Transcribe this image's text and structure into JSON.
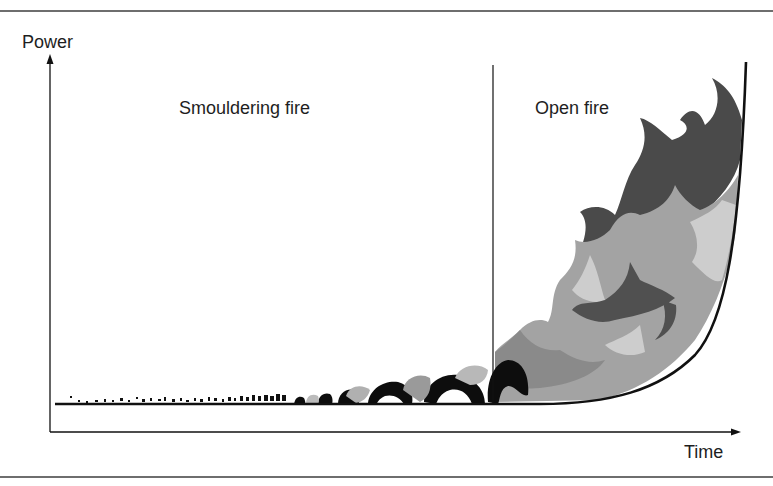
{
  "diagram": {
    "axes": {
      "y_label": "Power",
      "x_label": "Time"
    },
    "phases": [
      {
        "name": "smouldering",
        "label": "Smouldering fire"
      },
      {
        "name": "open",
        "label": "Open fire"
      }
    ],
    "colors": {
      "axis": "#111111",
      "rule": "#6e6e6e",
      "flame_dark": "#4a4a4a",
      "flame_mid": "#8c8c8c",
      "flame_light": "#b4b4b4",
      "flame_pale": "#cfcfcf",
      "smoke_black": "#0d0d0d"
    }
  }
}
